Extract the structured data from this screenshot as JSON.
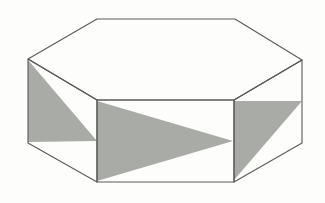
{
  "diagram": {
    "shape": "hexagonal-prism",
    "colors": {
      "background": "#fdfdfc",
      "edge": "#5a5a58",
      "shade": "#a9aba7"
    },
    "vertices": {
      "top_back_left": [
        97,
        19
      ],
      "top_back_right": [
        235,
        19
      ],
      "top_right": [
        302,
        60
      ],
      "top_front_right": [
        234,
        100
      ],
      "top_front_left": [
        97,
        100
      ],
      "top_left": [
        28,
        59
      ],
      "bottom_right": [
        302,
        143
      ],
      "bottom_front_right": [
        234,
        182
      ],
      "bottom_front_left": [
        97,
        182
      ],
      "bottom_left": [
        28,
        143
      ]
    },
    "faces": [
      {
        "name": "top",
        "points": "97,19 235,19 302,60 234,100 97,100 28,59"
      },
      {
        "name": "left-face",
        "points": "28,59 97,100 97,182 28,143"
      },
      {
        "name": "front-face",
        "points": "97,100 234,100 234,182 97,182"
      },
      {
        "name": "right-face",
        "points": "234,100 302,60 302,143 234,182"
      }
    ],
    "shaded_triangles": [
      {
        "face": "left",
        "points": "28,60 97,141 28,142"
      },
      {
        "face": "front",
        "points": "97,101 233,141 97,181"
      },
      {
        "face": "right",
        "points": "234,101 302,101 234,180"
      }
    ]
  }
}
